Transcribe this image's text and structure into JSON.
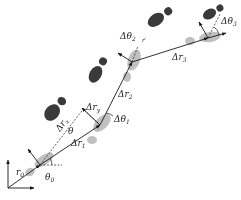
{
  "diagram": {
    "type": "pedestrian-dead-reckoning-footstep-trajectory",
    "colors": {
      "footprint_dark": "#3a3a3a",
      "footprint_light": "#b5b5b5",
      "line": "#1a1a1a",
      "background": "#ffffff"
    },
    "labels": {
      "r0": "r",
      "r0_sub": "0",
      "theta0": "θ",
      "theta0_sub": "0",
      "dr1": "Δr",
      "dr1_sub": "1",
      "dtheta1": "Δθ",
      "dtheta1_sub": "1",
      "dry": "Δr",
      "dry_sub": "y",
      "drx": "Δr",
      "drx_sub": "x",
      "theta": "θ",
      "dr2": "Δr",
      "dr2_sub": "2",
      "dtheta2": "Δθ",
      "dtheta2_sub": "2",
      "drprime": "r′",
      "dr3": "Δr",
      "dr3_sub": "3",
      "dtheta3": "Δθ",
      "dtheta3_sub": "3"
    },
    "nodes": [
      {
        "id": "p0",
        "x": 40,
        "y": 165,
        "desc": "origin step"
      },
      {
        "id": "p1",
        "x": 100,
        "y": 125,
        "desc": "step 1"
      },
      {
        "id": "p2",
        "x": 132,
        "y": 62,
        "desc": "step 2"
      },
      {
        "id": "p3",
        "x": 208,
        "y": 38,
        "desc": "step 3"
      }
    ],
    "dark_footprints": 4
  }
}
